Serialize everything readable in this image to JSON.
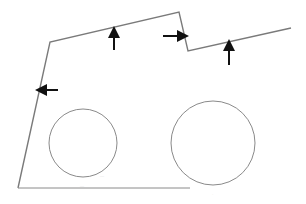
{
  "diagram": {
    "colors": {
      "outline": "#7a7a7a",
      "circle": "#8a8a8a",
      "arrow": "#111111",
      "label": "#d8d8d8"
    },
    "outline_points": [
      [
        18,
        188
      ],
      [
        50,
        42
      ],
      [
        179,
        12
      ],
      [
        188,
        51
      ],
      [
        291,
        28
      ]
    ],
    "base_line": {
      "x1": 18,
      "y1": 188,
      "x2": 190,
      "y2": 188
    },
    "circles": [
      {
        "name": "left-hole",
        "cx": 83,
        "cy": 143,
        "r": 34,
        "label": "—"
      },
      {
        "name": "right-hole",
        "cx": 213,
        "cy": 143,
        "r": 42,
        "label": "—"
      }
    ],
    "arrows": [
      {
        "name": "up-arrow-top-edge",
        "direction": "up",
        "x1": 114,
        "y1": 50,
        "x2": 114,
        "y2": 32
      },
      {
        "name": "right-arrow-notch",
        "direction": "right",
        "x1": 163,
        "y1": 36,
        "x2": 183,
        "y2": 36
      },
      {
        "name": "up-arrow-right-edge",
        "direction": "up",
        "x1": 229,
        "y1": 65,
        "x2": 229,
        "y2": 45
      },
      {
        "name": "left-arrow-left-edge",
        "direction": "left",
        "x1": 58,
        "y1": 90,
        "x2": 41,
        "y2": 90
      }
    ],
    "labels": [
      {
        "name": "left-circle-label",
        "text": "—",
        "x": 100,
        "y": 176
      },
      {
        "name": "base-line-label",
        "text": "—",
        "x": 80,
        "y": 186
      },
      {
        "name": "right-circle-label",
        "text": "·",
        "x": 212,
        "y": 195
      }
    ]
  }
}
